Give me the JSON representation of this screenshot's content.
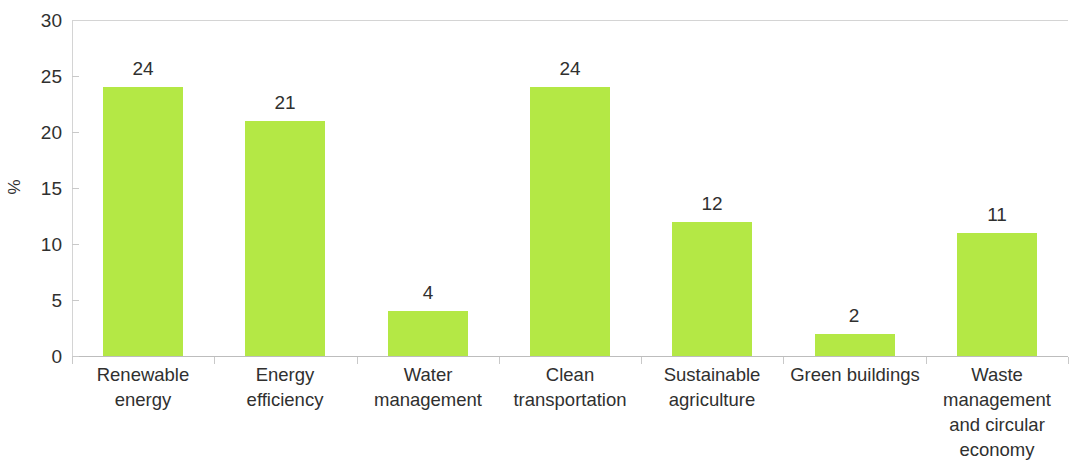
{
  "chart_data": {
    "type": "bar",
    "title": "",
    "subtitle": "",
    "xlabel": "",
    "ylabel": "%",
    "ylim": [
      0,
      30
    ],
    "y_ticks": [
      0,
      5,
      10,
      15,
      20,
      25,
      30
    ],
    "y_tick_labels": [
      "0",
      "5",
      "10",
      "15",
      "20",
      "25",
      "30"
    ],
    "grid": false,
    "legend": null,
    "bar_color": "#b4e845",
    "axis_color": "#c9c9c9",
    "text_color": "#30302f",
    "categories": [
      "Renewable\nenergy",
      "Energy\nefficiency",
      "Water\nmanagement",
      "Clean\ntransportation",
      "Sustainable\nagriculture",
      "Green buildings",
      "Waste\nmanagement\nand circular\neconomy"
    ],
    "category_lines": [
      [
        "Renewable",
        "energy"
      ],
      [
        "Energy",
        "efficiency"
      ],
      [
        "Water",
        "management"
      ],
      [
        "Clean",
        "transportation"
      ],
      [
        "Sustainable",
        "agriculture"
      ],
      [
        "Green buildings"
      ],
      [
        "Waste",
        "management",
        "and circular",
        "economy"
      ]
    ],
    "values": [
      24,
      21,
      4,
      24,
      12,
      2,
      11
    ],
    "value_labels": [
      "24",
      "21",
      "4",
      "24",
      "12",
      "2",
      "11"
    ]
  }
}
